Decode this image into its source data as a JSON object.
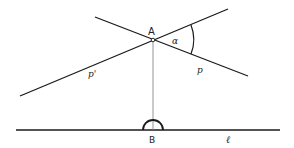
{
  "diagram": {
    "colors": {
      "line": "#1a1a1a",
      "perpendicular": "#888888",
      "background": "#ffffff"
    },
    "points": {
      "A": {
        "label": "A",
        "x": 153,
        "y": 40
      },
      "B": {
        "label": "B",
        "x": 153,
        "y": 130
      }
    },
    "lines": {
      "p": {
        "label": "p",
        "x1": 95,
        "y1": 17,
        "x2": 248,
        "y2": 76
      },
      "p_prime": {
        "label": "p'",
        "x1": 20,
        "y1": 96,
        "x2": 228,
        "y2": 9
      },
      "l": {
        "label": "ℓ",
        "x1": 16,
        "y1": 130,
        "x2": 280,
        "y2": 130
      },
      "perpendicular": {
        "x1": 153,
        "y1": 42,
        "x2": 153,
        "y2": 130
      }
    },
    "angle": {
      "label": "α"
    }
  }
}
